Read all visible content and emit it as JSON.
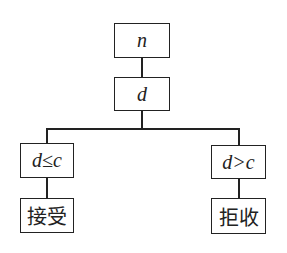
{
  "diagram": {
    "root": {
      "label": "n"
    },
    "decision": {
      "label": "d"
    },
    "left_branch": {
      "condition": "d≤c",
      "result": "接受"
    },
    "right_branch": {
      "condition": "d>c",
      "result": "拒收"
    }
  }
}
